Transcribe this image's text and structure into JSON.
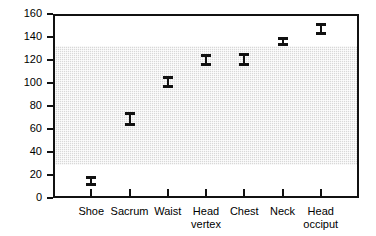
{
  "chart_data": {
    "type": "scatter",
    "title": "",
    "subtitle": "",
    "xlabel": "",
    "ylabel": "",
    "grid": false,
    "legend": null,
    "ylim": [
      0,
      160
    ],
    "yticks": [
      0,
      20,
      40,
      60,
      80,
      100,
      120,
      140,
      160
    ],
    "ytick_labels": [
      "0",
      "20",
      "40",
      "60",
      "80",
      "100",
      "120",
      "140",
      "160"
    ],
    "categories": [
      "Shoe",
      "Sacrum",
      "Waist",
      "Head\nvertex",
      "Chest",
      "Neck",
      "Head\nocciput"
    ],
    "series": [
      {
        "name": "measurement",
        "values": [
          15,
          69,
          101,
          120,
          121,
          136,
          147
        ],
        "err_low": [
          10,
          63,
          96,
          115,
          115,
          132,
          142
        ],
        "err_high": [
          19,
          75,
          106,
          125,
          126,
          140,
          152
        ]
      }
    ],
    "shaded_band": {
      "label": "reference range",
      "low": 30,
      "high": 134,
      "color": "#d8d8d8"
    },
    "colors": {
      "marker": "#111111",
      "axis": "#111111",
      "background": "#ffffff",
      "band": "#d8d8d8"
    }
  }
}
